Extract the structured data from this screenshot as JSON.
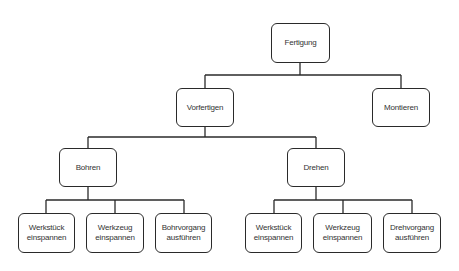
{
  "diagram": {
    "type": "tree",
    "line_color": "#2a2a2a",
    "text_color": "#333333",
    "nodes": {
      "root": {
        "label": "Fertigung"
      },
      "vorfertigen": {
        "label": "Vorfertigen"
      },
      "montieren": {
        "label": "Montieren"
      },
      "bohren": {
        "label": "Bohren"
      },
      "drehen": {
        "label": "Drehen"
      },
      "bohren_werkstueck": {
        "label": "Werkstück\neinspannen"
      },
      "bohren_werkzeug": {
        "label": "Werkzeug\neinspannen"
      },
      "bohrvorgang": {
        "label": "Bohrvorgang\nausführen"
      },
      "drehen_werkstueck": {
        "label": "Werkstück\neinspannen"
      },
      "drehen_werkzeug": {
        "label": "Werkzeug\neinspannen"
      },
      "drehvorgang": {
        "label": "Drehvorgang\nausführen"
      }
    },
    "edges": [
      [
        "Fertigung",
        "Vorfertigen"
      ],
      [
        "Fertigung",
        "Montieren"
      ],
      [
        "Vorfertigen",
        "Bohren"
      ],
      [
        "Vorfertigen",
        "Drehen"
      ],
      [
        "Bohren",
        "Werkstück einspannen"
      ],
      [
        "Bohren",
        "Werkzeug einspannen"
      ],
      [
        "Bohren",
        "Bohrvorgang ausführen"
      ],
      [
        "Drehen",
        "Werkstück einspannen"
      ],
      [
        "Drehen",
        "Werkzeug einspannen"
      ],
      [
        "Drehen",
        "Drehvorgang ausführen"
      ]
    ]
  }
}
